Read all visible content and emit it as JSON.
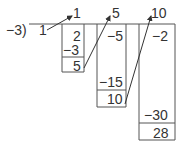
{
  "divisor": "−3)",
  "lead": "1",
  "top_row": [
    "1",
    "5",
    "10"
  ],
  "columns": [
    {
      "values": [
        "2",
        "−3"
      ],
      "result": "5"
    },
    {
      "values": [
        "−5",
        "−15"
      ],
      "result": "10"
    },
    {
      "values": [
        "−2",
        "−30"
      ],
      "result": "28"
    }
  ]
}
